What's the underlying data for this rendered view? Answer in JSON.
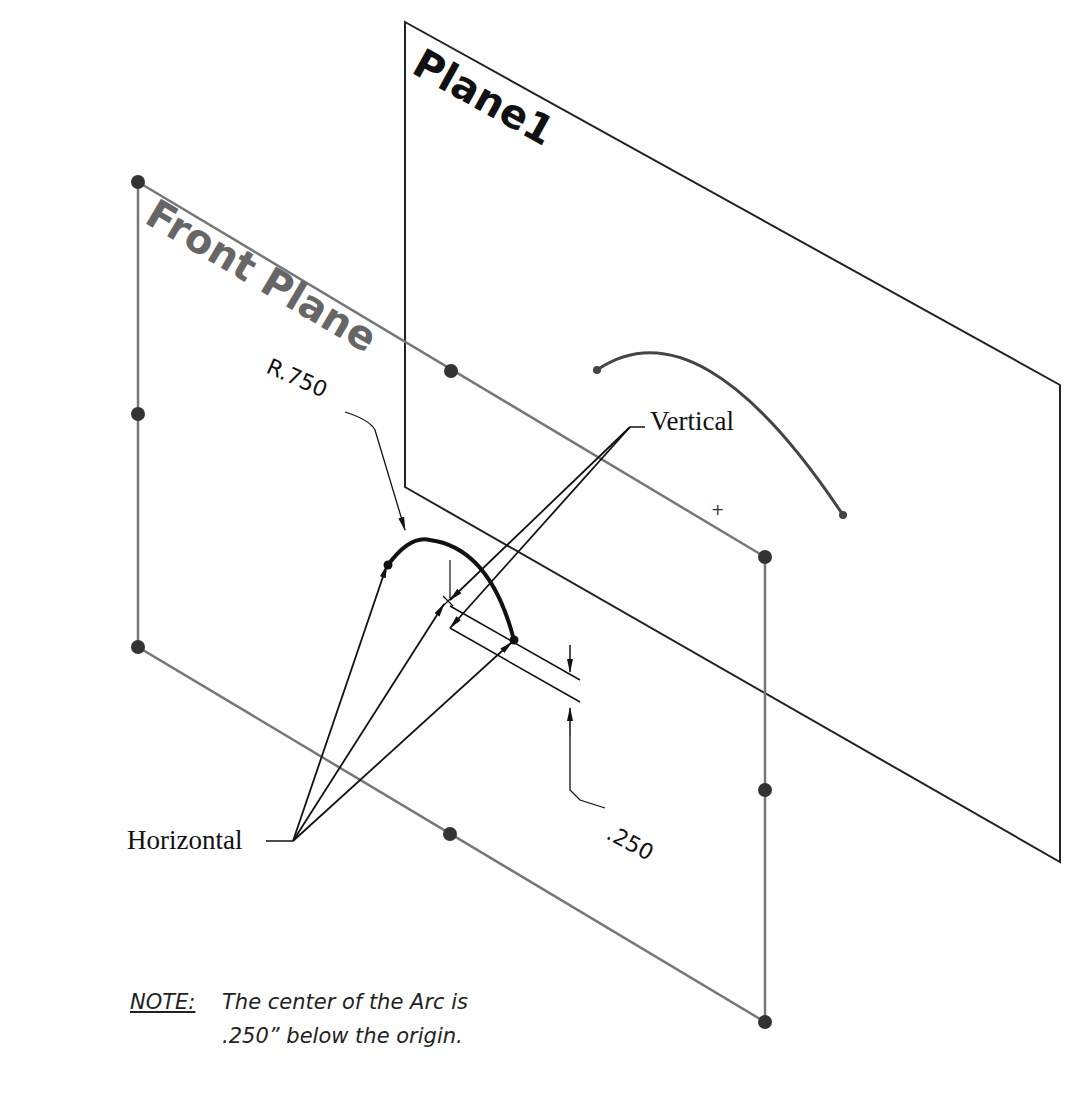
{
  "planes": {
    "plane1": {
      "label": "Plane1"
    },
    "front_plane": {
      "label": "Front Plane"
    }
  },
  "dimensions": {
    "radius": "R.750",
    "offset": ".250"
  },
  "callouts": {
    "vertical": "Vertical",
    "horizontal": "Horizontal"
  },
  "note": {
    "heading": "NOTE:",
    "line1": "The center of the Arc is",
    "line2": ".250” below the origin."
  },
  "colors": {
    "plane_edge": "#777777",
    "plane_edge_dark": "#222222",
    "handle": "#333333",
    "sketch": "#111111"
  }
}
